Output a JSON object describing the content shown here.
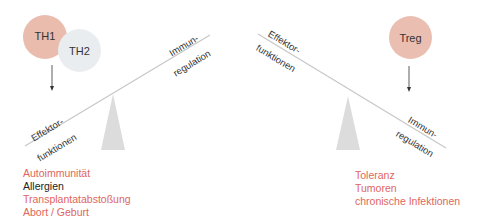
{
  "colors": {
    "th1_fill": "#e9bcae",
    "th2_fill": "#eaedf0",
    "treg_fill": "#eabfb2",
    "beam": "#c8c8c8",
    "fulcrum": "#d9d9d9",
    "red_text": "#e0665c",
    "black_text": "#222222",
    "arrow": "#333333"
  },
  "left_panel": {
    "cells": [
      {
        "label": "TH1"
      },
      {
        "label": "TH2"
      }
    ],
    "beam_high_label": [
      "Immun-",
      "regulation"
    ],
    "beam_low_label": [
      "Effektor-",
      "funktionen"
    ],
    "outcomes": [
      {
        "text": "Autoimmunität",
        "color": "red"
      },
      {
        "text": "Allergien",
        "color": "black"
      },
      {
        "text": "Transplantatabstoßung",
        "color": "red"
      },
      {
        "text": "Abort / Geburt",
        "color": "red"
      }
    ]
  },
  "right_panel": {
    "cells": [
      {
        "label": "Treg"
      }
    ],
    "beam_high_label": [
      "Effektor-",
      "funktionen"
    ],
    "beam_low_label": [
      "Immun-",
      "regulation"
    ],
    "outcomes": [
      {
        "text": "Toleranz",
        "color": "red"
      },
      {
        "text": "Tumoren",
        "color": "red"
      },
      {
        "text": "chronische Infektionen",
        "color": "red"
      }
    ]
  }
}
